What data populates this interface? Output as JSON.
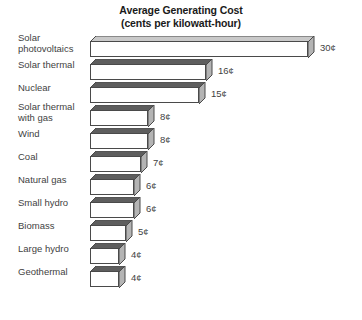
{
  "chart_data": {
    "type": "bar",
    "orientation": "horizontal",
    "title": "Average Generating Cost",
    "subtitle": "(cents per kilowatt-hour)",
    "xlabel": "",
    "ylabel": "",
    "unit": "¢",
    "xlim": [
      0,
      30
    ],
    "grid": false,
    "legend": null,
    "style": "3d-horizontal-bars",
    "categories": [
      "Solar\nphotovoltaics",
      "Solar thermal",
      "Nuclear",
      "Solar thermal\nwith gas",
      "Wind",
      "Coal",
      "Natural gas",
      "Small hydro",
      "Biomass",
      "Large hydro",
      "Geothermal"
    ],
    "values": [
      30,
      16,
      15,
      8,
      8,
      7,
      6,
      6,
      5,
      4,
      4
    ],
    "value_labels": [
      "30¢",
      "16¢",
      "15¢",
      "8¢",
      "8¢",
      "7¢",
      "6¢",
      "6¢",
      "5¢",
      "4¢",
      "4¢"
    ],
    "colors": {
      "bar_face": "#ffffff",
      "bar_outline": "#4a4a4a",
      "bar_top_dark": "#5e5e5e",
      "bar_top_light": "#c9c9c9",
      "bar_side": "#b4b4b4",
      "text": "#3f3f3f",
      "title": "#1a1a1a",
      "background": "#ffffff"
    }
  },
  "rows": [
    {
      "label": "Solar\nphotovoltaics",
      "value": 30,
      "value_label": "30¢",
      "two_line": true,
      "top_light": true
    },
    {
      "label": "Solar thermal",
      "value": 16,
      "value_label": "16¢",
      "two_line": false,
      "top_light": false
    },
    {
      "label": "Nuclear",
      "value": 15,
      "value_label": "15¢",
      "two_line": false,
      "top_light": false
    },
    {
      "label": "Solar thermal\nwith gas",
      "value": 8,
      "value_label": "8¢",
      "two_line": true,
      "top_light": false
    },
    {
      "label": "Wind",
      "value": 8,
      "value_label": "8¢",
      "two_line": false,
      "top_light": false
    },
    {
      "label": "Coal",
      "value": 7,
      "value_label": "7¢",
      "two_line": false,
      "top_light": false
    },
    {
      "label": "Natural gas",
      "value": 6,
      "value_label": "6¢",
      "two_line": false,
      "top_light": false
    },
    {
      "label": "Small hydro",
      "value": 6,
      "value_label": "6¢",
      "two_line": false,
      "top_light": false
    },
    {
      "label": "Biomass",
      "value": 5,
      "value_label": "5¢",
      "two_line": false,
      "top_light": false
    },
    {
      "label": "Large hydro",
      "value": 4,
      "value_label": "4¢",
      "two_line": false,
      "top_light": false
    },
    {
      "label": "Geothermal",
      "value": 4,
      "value_label": "4¢",
      "two_line": false,
      "top_light": false
    }
  ],
  "layout": {
    "px_per_cent": 7.25,
    "bar_left": 90,
    "row_pitch": 23,
    "depth": 6
  }
}
